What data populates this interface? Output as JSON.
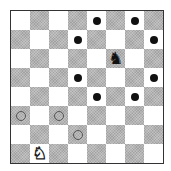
{
  "board": {
    "size": 8,
    "colors": {
      "light": "#ffffff",
      "dark": "#b4b4b4",
      "border": "#333333"
    },
    "pieces": [
      {
        "type": "knight",
        "color": "black",
        "row": 2,
        "col": 5,
        "glyph": "♞"
      },
      {
        "type": "knight",
        "color": "white",
        "row": 7,
        "col": 1,
        "glyph": "♘"
      }
    ],
    "markers": [
      {
        "kind": "filled-dot",
        "row": 0,
        "col": 4
      },
      {
        "kind": "filled-dot",
        "row": 0,
        "col": 6
      },
      {
        "kind": "filled-dot",
        "row": 1,
        "col": 3
      },
      {
        "kind": "filled-dot",
        "row": 1,
        "col": 7
      },
      {
        "kind": "filled-dot",
        "row": 3,
        "col": 3
      },
      {
        "kind": "filled-dot",
        "row": 3,
        "col": 7
      },
      {
        "kind": "filled-dot",
        "row": 4,
        "col": 4
      },
      {
        "kind": "filled-dot",
        "row": 4,
        "col": 6
      },
      {
        "kind": "hollow-circle",
        "row": 5,
        "col": 0
      },
      {
        "kind": "hollow-circle",
        "row": 5,
        "col": 2
      },
      {
        "kind": "hollow-circle",
        "row": 6,
        "col": 3
      }
    ]
  }
}
